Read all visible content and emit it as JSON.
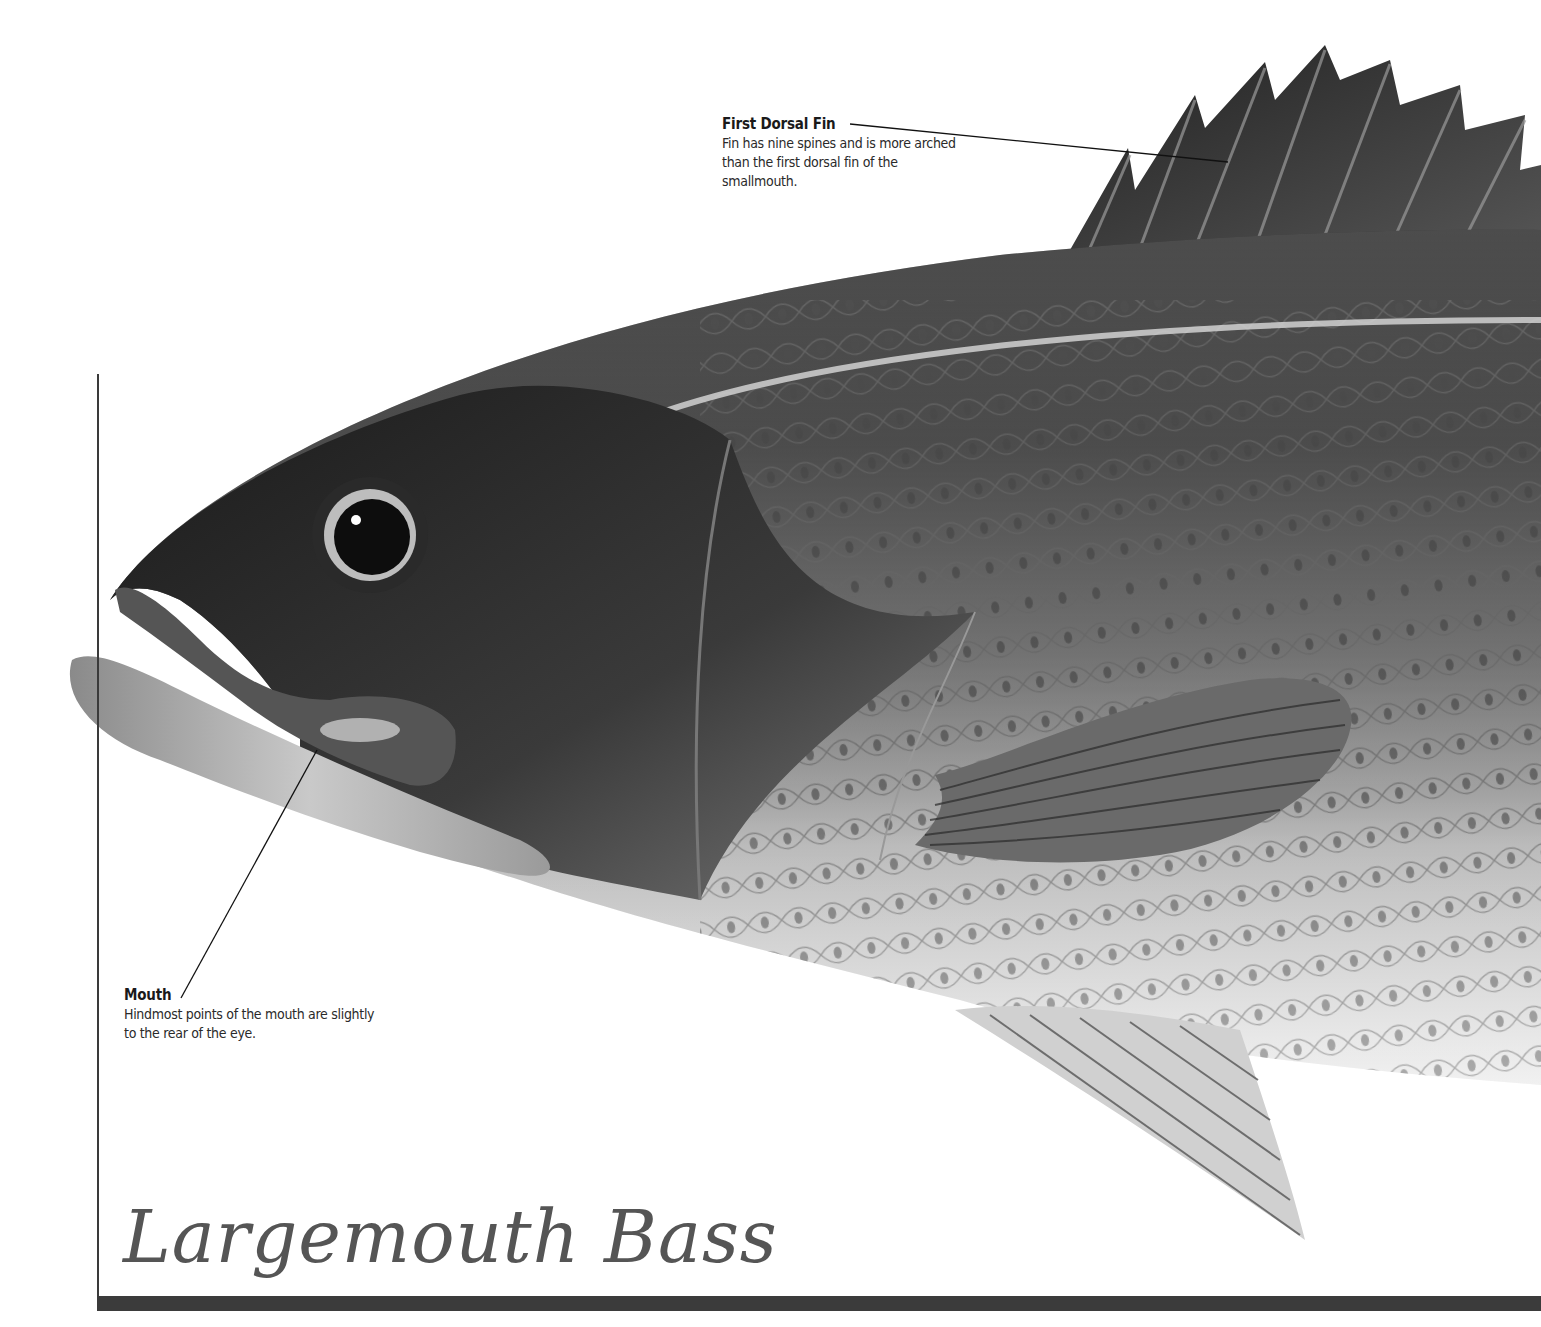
{
  "title": "Largemouth Bass",
  "callouts": [
    {
      "id": "first-dorsal-fin",
      "title": "First Dorsal Fin",
      "body": "Fin has nine spines and is more arched than the first dorsal fin of the smallmouth."
    },
    {
      "id": "mouth",
      "title": "Mouth",
      "body": "Hindmost points of the mouth are slightly to the rear of the eye."
    }
  ],
  "illustration": {
    "subject": "largemouth-bass-head-illustration",
    "palette": {
      "background": "#ffffff",
      "body_dark": "#1c1c1c",
      "body_mid": "#6e6e6e",
      "belly_light": "#e6e6e6",
      "frame": "#3a3a3a",
      "title_text": "#555555"
    }
  }
}
